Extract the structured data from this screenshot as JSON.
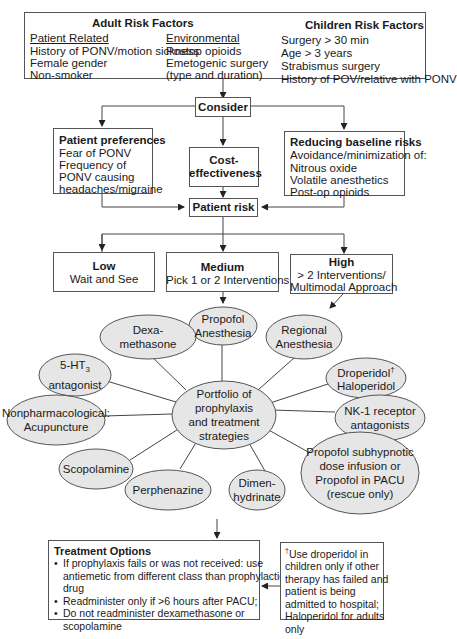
{
  "risk_factors": {
    "adult_title": "Adult Risk Factors",
    "children_title": "Children Risk Factors",
    "patient_related": {
      "heading": "Patient Related",
      "items": [
        "History of PONV/motion sickness",
        "Female gender",
        "Non-smoker"
      ]
    },
    "environmental": {
      "heading": "Environmental",
      "items": [
        "Postop opioids",
        "Emetogenic surgery",
        "(type and duration)"
      ]
    },
    "children": {
      "items": [
        "Surgery > 30 min",
        "Age > 3 years",
        "Strabismus surgery",
        "History of POV/relative with PONV"
      ]
    }
  },
  "consider": {
    "label": "Consider"
  },
  "patient_preferences": {
    "title": "Patient preferences",
    "items": [
      "Fear of PONV",
      "Frequency of",
      "PONV causing",
      "headaches/migraine"
    ]
  },
  "cost_effectiveness": {
    "line1": "Cost-",
    "line2": "effectiveness"
  },
  "reducing_risks": {
    "title": "Reducing baseline risks",
    "items": [
      "Avoidance/minimization of:",
      "Nitrous oxide",
      "Volatile anesthetics",
      "Post-op opioids"
    ]
  },
  "patient_risk": {
    "label": "Patient risk"
  },
  "risk_levels": {
    "low": {
      "title": "Low",
      "lines": [
        "Wait and See"
      ]
    },
    "medium": {
      "title": "Medium",
      "lines": [
        "Pick 1 or 2 Interventions"
      ]
    },
    "high": {
      "title": "High",
      "lines": [
        "> 2 Interventions/",
        "Multimodal Approach"
      ]
    }
  },
  "portfolio": {
    "center": [
      "Portfolio of",
      "prophylaxis",
      "and treatment",
      "strategies"
    ],
    "nodes": {
      "propofol_anesthesia": [
        "Propofol",
        "Anesthesia"
      ],
      "dexamethasone": [
        "Dexa-",
        "methasone"
      ],
      "regional_anesthesia": [
        "Regional",
        "Anesthesia"
      ],
      "ht3_antagonist": [
        "5-HT",
        "3",
        "antagonist"
      ],
      "droperidol": [
        "Droperidol",
        "†",
        "Haloperidol"
      ],
      "nonpharmacological": [
        "Nonpharmacological:",
        "Acupuncture"
      ],
      "nk1": [
        "NK-1 receptor",
        "antagonists"
      ],
      "scopolamine": [
        "Scopolamine"
      ],
      "perphenazine": [
        "Perphenazine"
      ],
      "dimenhydrinate": [
        "Dimen-",
        "hydrinate"
      ],
      "propofol_subhypnotic": [
        "Propofol subhypnotic",
        "dose infusion or",
        "Propofol in PACU",
        "(rescue only)"
      ]
    }
  },
  "treatment_options": {
    "title": "Treatment Options",
    "bullets": [
      [
        "If prophylaxis fails or was not received: use",
        "antiemetic from different class than prophylactic",
        "drug"
      ],
      [
        "Readminister only if >6 hours after PACU;"
      ],
      [
        "Do not readminister dexamethasone or",
        "scopolamine"
      ]
    ]
  },
  "footnote": {
    "dagger": "†",
    "lines": [
      "Use droperidol in",
      "children only if other",
      "therapy has failed and",
      "patient is being",
      "admitted to hospital;",
      "Haloperidol for adults",
      "only"
    ]
  },
  "colors": {
    "ellipse_fill": "#e6e6e6",
    "stroke": "#555555"
  }
}
